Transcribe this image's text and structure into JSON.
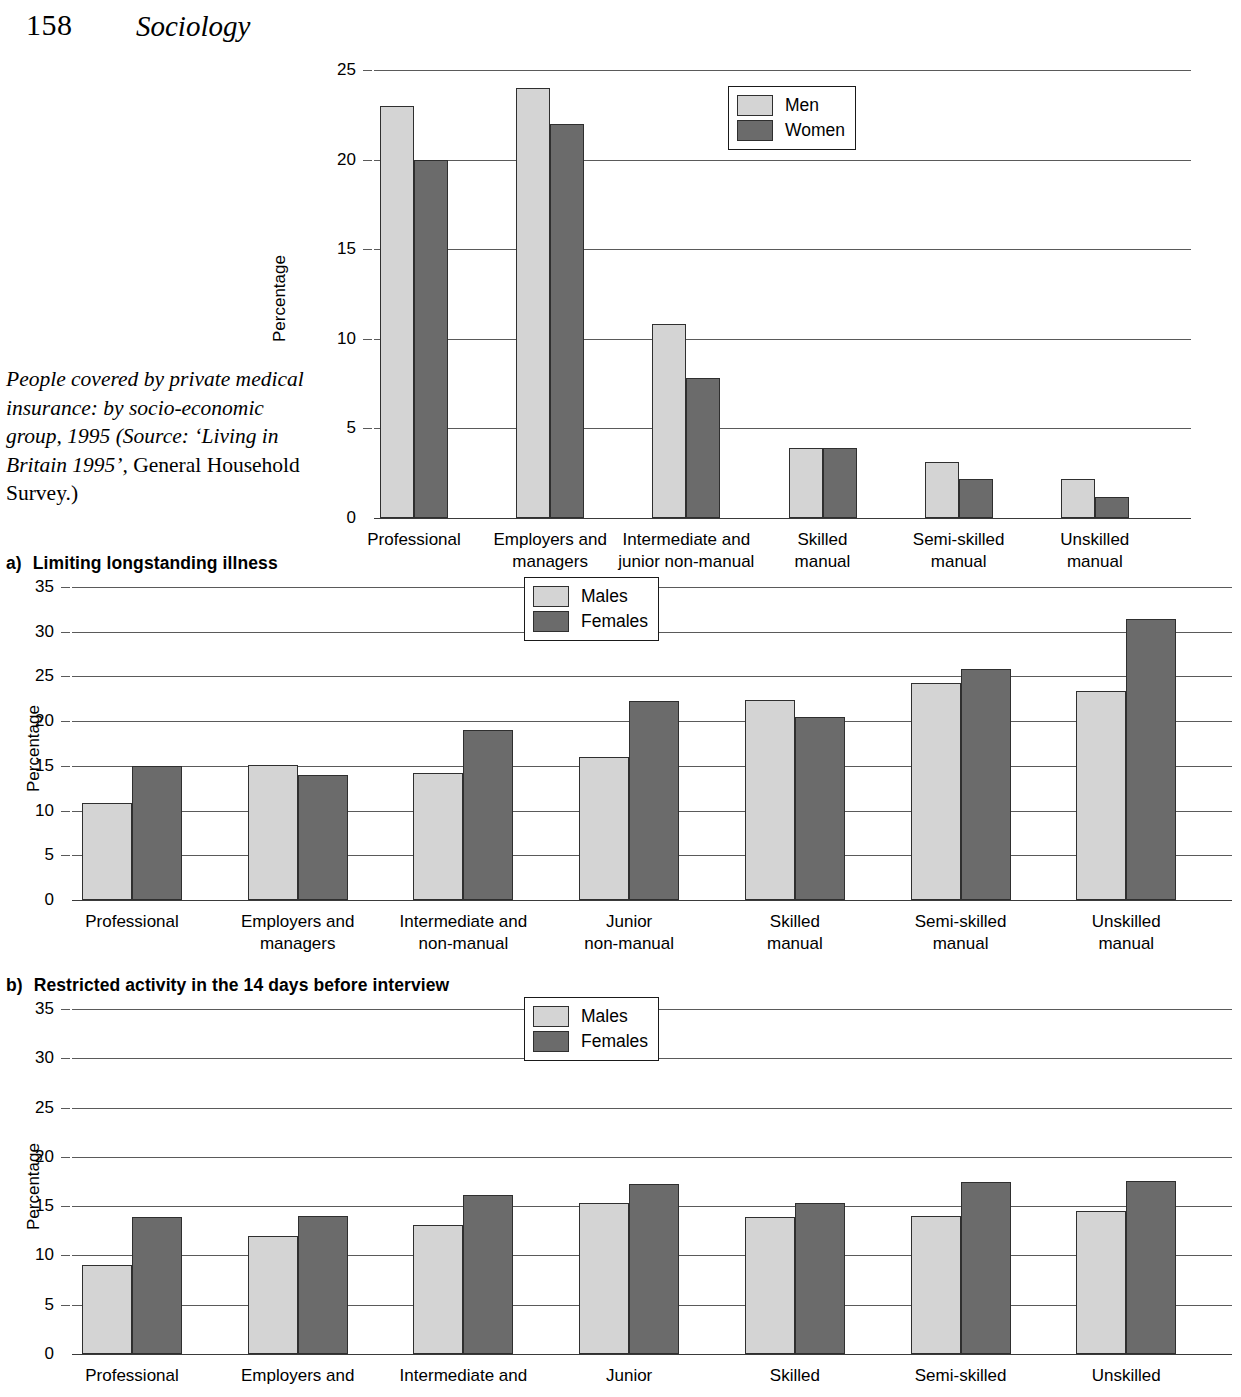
{
  "page": {
    "number": "158",
    "running_title": "Sociology"
  },
  "side_caption": {
    "italic_part": "People covered by private medical insurance: by socio-economic group, 1995 (Source: ‘Living in Britain 1995’,",
    "roman_part": " General Household Survey.)"
  },
  "sections": {
    "a": {
      "marker": "a)",
      "title": "Limiting longstanding illness"
    },
    "b": {
      "marker": "b)",
      "title": "Restricted activity in the 14 days before interview"
    }
  },
  "chart_data": [
    {
      "id": "private-medical-insurance",
      "type": "bar",
      "title": "People covered by private medical insurance: by socio-economic group, 1995",
      "xlabel": "",
      "ylabel": "Percentage",
      "ylim": [
        0,
        25
      ],
      "yticks": [
        0,
        5,
        10,
        15,
        20,
        25
      ],
      "ytick_labels": [
        "0",
        "5",
        "10",
        "15",
        "20",
        "25"
      ],
      "grid": true,
      "legend_position": "top-right",
      "categories": [
        "Professional",
        "Employers and\nmanagers",
        "Intermediate and\njunior non-manual",
        "Skilled\nmanual",
        "Semi-skilled\nmanual",
        "Unskilled\nmanual"
      ],
      "series": [
        {
          "name": "Men",
          "color": "#d4d4d4",
          "values": [
            23.0,
            24.0,
            10.8,
            3.9,
            3.1,
            2.2
          ]
        },
        {
          "name": "Women",
          "color": "#6b6b6b",
          "values": [
            20.0,
            22.0,
            7.8,
            3.9,
            2.2,
            1.2
          ]
        }
      ]
    },
    {
      "id": "limiting-longstanding-illness",
      "type": "bar",
      "title": "Limiting longstanding illness",
      "xlabel": "",
      "ylabel": "Percentage",
      "ylim": [
        0,
        35
      ],
      "yticks": [
        0,
        5,
        10,
        15,
        20,
        25,
        30,
        35
      ],
      "ytick_labels": [
        "0",
        "5",
        "10",
        "15",
        "20",
        "25",
        "30",
        "35"
      ],
      "grid": true,
      "legend_position": "top-center",
      "categories": [
        "Professional",
        "Employers and\nmanagers",
        "Intermediate and\nnon-manual",
        "Junior\nnon-manual",
        "Skilled\nmanual",
        "Semi-skilled\nmanual",
        "Unskilled\nmanual"
      ],
      "series": [
        {
          "name": "Males",
          "color": "#d4d4d4",
          "values": [
            10.8,
            15.1,
            14.2,
            16.0,
            22.4,
            24.3,
            23.4
          ]
        },
        {
          "name": "Females",
          "color": "#6b6b6b",
          "values": [
            15.0,
            14.0,
            19.0,
            22.3,
            20.5,
            25.8,
            31.4
          ]
        }
      ]
    },
    {
      "id": "restricted-activity-14-days",
      "type": "bar",
      "title": "Restricted activity in the 14 days before interview",
      "xlabel": "",
      "ylabel": "Percentage",
      "ylim": [
        0,
        35
      ],
      "yticks": [
        0,
        5,
        10,
        15,
        20,
        25,
        30,
        35
      ],
      "ytick_labels": [
        "0",
        "5",
        "10",
        "15",
        "20",
        "25",
        "30",
        "35"
      ],
      "grid": true,
      "legend_position": "top-center",
      "categories": [
        "Professional",
        "Employers and",
        "Intermediate and",
        "Junior",
        "Skilled",
        "Semi-skilled",
        "Unskilled"
      ],
      "series": [
        {
          "name": "Males",
          "color": "#d4d4d4",
          "values": [
            9.0,
            12.0,
            13.1,
            15.3,
            13.9,
            14.0,
            14.5
          ]
        },
        {
          "name": "Females",
          "color": "#6b6b6b",
          "values": [
            13.9,
            14.0,
            16.1,
            17.2,
            15.3,
            17.5,
            17.6
          ]
        }
      ]
    }
  ]
}
